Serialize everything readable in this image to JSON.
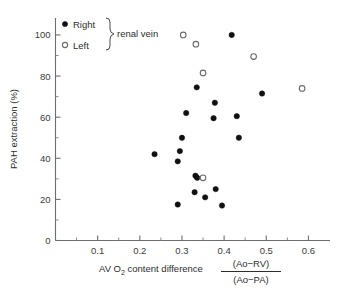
{
  "chart_data": {
    "type": "scatter",
    "title": "",
    "xlabel": "AV O2 content difference (Ao-RV)/(Ao-PA)",
    "ylabel": "PAH extraction (%)",
    "xlabel_main": "AV O",
    "xlabel_sub": "2",
    "xlabel_rest": " content difference",
    "xlabel_frac_num": "(Ao−RV)",
    "xlabel_frac_den": "(Ao−PA)",
    "ylim": [
      0,
      108
    ],
    "xlim": [
      0,
      0.65
    ],
    "grid": false,
    "legend_position": "top-left",
    "xticks": [
      0.1,
      0.2,
      0.3,
      0.4,
      0.5,
      0.6
    ],
    "xticklabels": [
      "0.1",
      "0.2",
      "0.3",
      "0.4",
      "0.5",
      "0.6"
    ],
    "xticks_minor": [
      0.05,
      0.15,
      0.25,
      0.35,
      0.45,
      0.55
    ],
    "yticks": [
      0,
      20,
      40,
      60,
      80,
      100
    ],
    "yticklabels": [
      "0",
      "20",
      "40",
      "60",
      "80",
      "100"
    ],
    "yticks_minor": [
      10,
      30,
      50,
      70,
      90
    ],
    "legend_bracket_label": "renal vein",
    "series": [
      {
        "name": "Right",
        "marker": "filled-circle",
        "color": "#111111",
        "points": [
          [
            0.235,
            42.0
          ],
          [
            0.29,
            38.5
          ],
          [
            0.295,
            43.5
          ],
          [
            0.3,
            50.0
          ],
          [
            0.29,
            17.5
          ],
          [
            0.31,
            62.0
          ],
          [
            0.33,
            23.5
          ],
          [
            0.332,
            31.5
          ],
          [
            0.336,
            30.5
          ],
          [
            0.335,
            74.5
          ],
          [
            0.355,
            21.0
          ],
          [
            0.375,
            59.5
          ],
          [
            0.378,
            67.0
          ],
          [
            0.38,
            25.0
          ],
          [
            0.395,
            17.0
          ],
          [
            0.418,
            100.0
          ],
          [
            0.43,
            60.5
          ],
          [
            0.435,
            50.0
          ],
          [
            0.49,
            71.5
          ]
        ]
      },
      {
        "name": "Left",
        "marker": "open-circle",
        "color": "#6a6a6a",
        "points": [
          [
            0.303,
            100.0
          ],
          [
            0.333,
            95.5
          ],
          [
            0.35,
            81.5
          ],
          [
            0.35,
            30.5
          ],
          [
            0.47,
            89.5
          ],
          [
            0.585,
            74.0
          ]
        ]
      }
    ]
  },
  "legend": {
    "items": [
      {
        "label": "Right",
        "marker": "filled-circle"
      },
      {
        "label": "Left",
        "marker": "open-circle"
      }
    ],
    "bracket_label": "renal vein"
  }
}
